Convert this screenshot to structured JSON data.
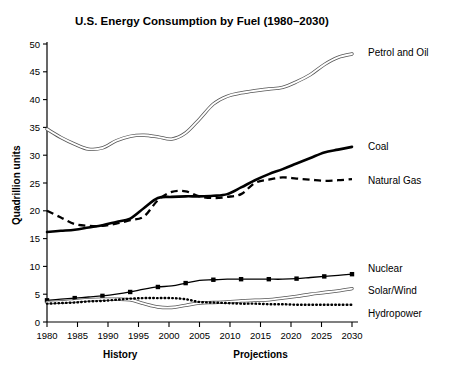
{
  "chart_data": {
    "type": "line",
    "title": "U.S. Energy Consumption by Fuel (1980–2030)",
    "xlabel": "",
    "ylabel": "Quadrillion units",
    "xlim": [
      1980,
      2030
    ],
    "ylim": [
      0,
      50
    ],
    "xticks": [
      "1980",
      "1985",
      "1990",
      "1995",
      "2000",
      "2005",
      "2010",
      "2015",
      "2020",
      "2025",
      "2030"
    ],
    "yticks": [
      "0",
      "5",
      "10",
      "15",
      "20",
      "25",
      "30",
      "35",
      "40",
      "45",
      "50"
    ],
    "grid": false,
    "legend_position": "right-inline",
    "annotations": [
      {
        "text": "History",
        "x": 1992
      },
      {
        "text": "Projections",
        "x": 2015
      }
    ],
    "x": [
      1980,
      1985,
      1990,
      1995,
      2000,
      2005,
      2010,
      2015,
      2020,
      2025,
      2030
    ],
    "series": [
      {
        "name": "Petrol and Oil",
        "style": "double-line",
        "label": "Petrol and Oil",
        "values": [
          34.7,
          32.0,
          31.2,
          33.3,
          33.6,
          32.9,
          36.5,
          40.6,
          41.6,
          42.2,
          44.5
        ],
        "values_fine": [
          34.7,
          33.2,
          32.0,
          31.1,
          31.3,
          32.6,
          33.4,
          33.6,
          33.3,
          32.9,
          34.0,
          36.5,
          39.2,
          40.6,
          41.2,
          41.6,
          41.9,
          42.2,
          43.2,
          44.5,
          46.3,
          47.6,
          48.2
        ]
      },
      {
        "name": "Coal",
        "style": "solid-thick",
        "label": "Coal",
        "values": [
          16.2,
          16.6,
          17.4,
          18.6,
          22.5,
          22.6,
          23.0,
          25.5,
          27.5,
          29.5,
          31.5
        ],
        "values_fine": [
          16.2,
          16.4,
          16.6,
          17.0,
          17.4,
          18.0,
          18.6,
          20.5,
          22.3,
          22.5,
          22.6,
          22.6,
          22.7,
          23.0,
          24.2,
          25.5,
          26.6,
          27.5,
          28.5,
          29.5,
          30.5,
          31.0,
          31.5
        ]
      },
      {
        "name": "Natural Gas",
        "style": "dashed",
        "label": "Natural Gas",
        "values": [
          20.0,
          17.6,
          17.3,
          18.3,
          23.4,
          22.3,
          23.0,
          25.6,
          25.8,
          25.6,
          25.7
        ],
        "values_fine": [
          20.0,
          18.8,
          17.6,
          17.3,
          17.3,
          17.7,
          18.3,
          19.0,
          21.9,
          23.4,
          23.5,
          22.6,
          22.3,
          22.5,
          23.0,
          25.0,
          25.6,
          26.0,
          25.8,
          25.6,
          25.4,
          25.5,
          25.7
        ]
      },
      {
        "name": "Nuclear",
        "style": "solid-markers",
        "label": "Nuclear",
        "values": [
          3.9,
          4.3,
          4.7,
          5.4,
          6.5,
          7.6,
          7.7,
          7.7,
          7.7,
          8.0,
          8.6
        ],
        "values_fine": [
          3.9,
          4.1,
          4.3,
          4.5,
          4.7,
          5.0,
          5.4,
          5.9,
          6.3,
          6.5,
          7.0,
          7.5,
          7.6,
          7.7,
          7.7,
          7.7,
          7.7,
          7.7,
          7.8,
          8.0,
          8.2,
          8.4,
          8.6
        ]
      },
      {
        "name": "Solar/Wind",
        "style": "double-line",
        "label": "Solar/Wind",
        "values": [
          3.5,
          3.8,
          4.1,
          4.0,
          2.6,
          3.5,
          3.8,
          4.0,
          4.6,
          5.3,
          6.0
        ],
        "values_fine": [
          3.5,
          3.6,
          3.8,
          4.0,
          4.1,
          4.1,
          4.0,
          3.3,
          2.7,
          2.6,
          3.0,
          3.4,
          3.5,
          3.6,
          3.8,
          3.9,
          4.0,
          4.3,
          4.6,
          5.0,
          5.3,
          5.6,
          6.0
        ]
      },
      {
        "name": "Hydropower",
        "style": "dotted",
        "label": "Hydropower",
        "values": [
          3.3,
          3.5,
          3.8,
          4.2,
          4.3,
          3.5,
          3.3,
          3.2,
          3.1,
          3.1,
          3.1
        ],
        "values_fine": [
          3.3,
          3.4,
          3.5,
          3.7,
          3.8,
          4.0,
          4.2,
          4.3,
          4.3,
          4.3,
          4.1,
          3.6,
          3.5,
          3.4,
          3.3,
          3.3,
          3.2,
          3.2,
          3.1,
          3.1,
          3.1,
          3.1,
          3.1
        ]
      }
    ]
  }
}
